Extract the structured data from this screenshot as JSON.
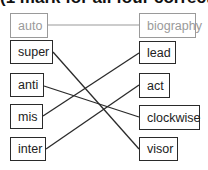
{
  "title": "(1 mark for all four correct)",
  "example": {
    "left": "auto",
    "right": "biography"
  },
  "left_items": [
    "super",
    "anti",
    "mis",
    "inter"
  ],
  "right_items": [
    "lead",
    "act",
    "clockwise",
    "visor"
  ],
  "connections": [
    {
      "from": "auto",
      "to": "biography",
      "example": true
    },
    {
      "from": "super",
      "to": "visor"
    },
    {
      "from": "anti",
      "to": "clockwise"
    },
    {
      "from": "mis",
      "to": "lead"
    },
    {
      "from": "inter",
      "to": "act"
    }
  ]
}
